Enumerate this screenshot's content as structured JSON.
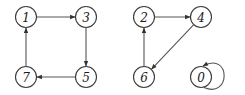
{
  "diagram": {
    "type": "directed-graph",
    "nodes": [
      {
        "id": "1",
        "label": "1",
        "x": 26,
        "y": 17
      },
      {
        "id": "3",
        "label": "3",
        "x": 86,
        "y": 17
      },
      {
        "id": "5",
        "label": "5",
        "x": 86,
        "y": 77
      },
      {
        "id": "7",
        "label": "7",
        "x": 26,
        "y": 77
      },
      {
        "id": "2",
        "label": "2",
        "x": 144,
        "y": 17
      },
      {
        "id": "4",
        "label": "4",
        "x": 201,
        "y": 17
      },
      {
        "id": "6",
        "label": "6",
        "x": 144,
        "y": 77
      },
      {
        "id": "0",
        "label": "0",
        "x": 201,
        "y": 77
      }
    ],
    "edges": [
      {
        "from": "1",
        "to": "3"
      },
      {
        "from": "3",
        "to": "5"
      },
      {
        "from": "5",
        "to": "7"
      },
      {
        "from": "7",
        "to": "1"
      },
      {
        "from": "2",
        "to": "4"
      },
      {
        "from": "4",
        "to": "6"
      },
      {
        "from": "6",
        "to": "2"
      },
      {
        "from": "0",
        "to": "0"
      }
    ],
    "colors": {
      "stroke": "#3a3a3a",
      "edge": "#555555",
      "background": "#ffffff"
    }
  }
}
